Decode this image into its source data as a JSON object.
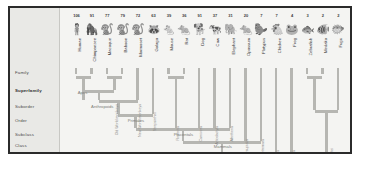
{
  "figure": {
    "frame_color": "#2b2b2b",
    "background": "#f4f4f2",
    "branch_color": "#b6b6b2"
  },
  "ranks": [
    {
      "label": "Family",
      "bold": false
    },
    {
      "label": "Superfamily",
      "bold": true
    },
    {
      "label": "Suborder",
      "bold": false
    },
    {
      "label": "Order",
      "bold": false
    },
    {
      "label": "Subclass",
      "bold": false
    },
    {
      "label": "Class",
      "bold": false
    },
    {
      "label": "Subphylum",
      "bold": false
    }
  ],
  "taxa": [
    {
      "count": "106",
      "name": "Human",
      "icon": "human-icon",
      "glyph": "🧍"
    },
    {
      "count": "91",
      "name": "Chimpanzee",
      "icon": "chimpanzee-icon",
      "glyph": "🦍"
    },
    {
      "count": "77",
      "name": "Macaque",
      "icon": "macaque-icon",
      "glyph": "🐒"
    },
    {
      "count": "79",
      "name": "Baboon",
      "icon": "baboon-icon",
      "glyph": "🐒"
    },
    {
      "count": "72",
      "name": "Marmoset",
      "icon": "marmoset-icon",
      "glyph": "🐒"
    },
    {
      "count": "63",
      "name": "Galago",
      "icon": "galago-icon",
      "glyph": "🦝"
    },
    {
      "count": "39",
      "name": "Mouse",
      "icon": "mouse-icon",
      "glyph": "🐁"
    },
    {
      "count": "36",
      "name": "Rat",
      "icon": "rat-icon",
      "glyph": "🐀"
    },
    {
      "count": "91",
      "name": "Dog",
      "icon": "dog-icon",
      "glyph": "🐕"
    },
    {
      "count": "37",
      "name": "Cow",
      "icon": "cow-icon",
      "glyph": "🐄"
    },
    {
      "count": "31",
      "name": "Elephant",
      "icon": "elephant-icon",
      "glyph": "🐘"
    },
    {
      "count": "20",
      "name": "Opossum",
      "icon": "opossum-icon",
      "glyph": "🐀"
    },
    {
      "count": "7",
      "name": "Platypus",
      "icon": "platypus-icon",
      "glyph": "🦫"
    },
    {
      "count": "7",
      "name": "Chicken",
      "icon": "chicken-icon",
      "glyph": "🐔"
    },
    {
      "count": "4",
      "name": "Frog",
      "icon": "frog-icon",
      "glyph": "🐸"
    },
    {
      "count": "3",
      "name": "Zebrafish",
      "icon": "zebrafish-icon",
      "glyph": "🐟"
    },
    {
      "count": "2",
      "name": "Medaka",
      "icon": "medaka-icon",
      "glyph": "🐠"
    },
    {
      "count": "2",
      "name": "Fugu",
      "icon": "fugu-icon",
      "glyph": "🐡"
    }
  ],
  "clades_horizontal": [
    {
      "label": "Apes"
    },
    {
      "label": "Anthropoids"
    },
    {
      "label": "Primates"
    },
    {
      "label": "Placentals"
    },
    {
      "label": "Mammals"
    },
    {
      "label": "Vertebrates"
    }
  ],
  "clades_vertical": [
    {
      "label": "Old World monkeys"
    },
    {
      "label": "New World monkeys"
    },
    {
      "label": "Strepsirrhini"
    },
    {
      "label": "Rodentia"
    },
    {
      "label": "Carnivora"
    },
    {
      "label": "Artiodactyla"
    },
    {
      "label": "Afrotheria"
    },
    {
      "label": "Marsupialia"
    },
    {
      "label": "Monotremata"
    },
    {
      "label": "Aves"
    },
    {
      "label": "Amphibia"
    },
    {
      "label": "Teleostei"
    }
  ],
  "chart_data": {
    "type": "table",
    "categories": [
      "Human",
      "Chimpanzee",
      "Macaque",
      "Baboon",
      "Marmoset",
      "Galago",
      "Mouse",
      "Rat",
      "Dog",
      "Cow",
      "Elephant",
      "Opossum",
      "Platypus",
      "Chicken",
      "Frog",
      "Zebrafish",
      "Medaka",
      "Fugu"
    ],
    "values": [
      106,
      91,
      77,
      79,
      72,
      63,
      39,
      36,
      91,
      37,
      31,
      20,
      7,
      7,
      4,
      3,
      2,
      2
    ],
    "xlabel": "Species",
    "ylabel": "Count",
    "ranks": [
      "Family",
      "Superfamily",
      "Suborder",
      "Order",
      "Subclass",
      "Class",
      "Subphylum"
    ],
    "clades": [
      "Apes",
      "Anthropoids",
      "Primates",
      "Placentals",
      "Mammals",
      "Vertebrates"
    ]
  }
}
